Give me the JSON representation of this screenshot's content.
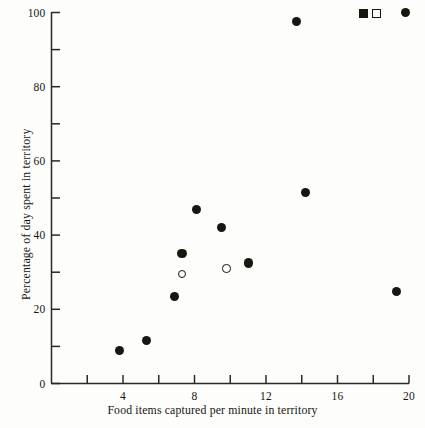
{
  "chart_data": {
    "type": "scatter",
    "title": "",
    "xlabel": "Food items captured per minute in territory",
    "ylabel": "Percentage of day spent in territory",
    "xlim": [
      0,
      20
    ],
    "ylim": [
      0,
      100
    ],
    "grid": false,
    "x_major_ticks": [
      4,
      8,
      12,
      16,
      20
    ],
    "x_minor_ticks": [
      2,
      6,
      10,
      14,
      18
    ],
    "x_tick_labels": [
      "4",
      "8",
      "12",
      "16",
      "20"
    ],
    "y_major_ticks": [
      0,
      20,
      40,
      60,
      80,
      100
    ],
    "y_minor_ticks": [
      10,
      30,
      50,
      70,
      90
    ],
    "y_tick_labels": [
      "0",
      "20",
      "40",
      "60",
      "80",
      "100"
    ],
    "legend_position": "top-right",
    "legend": [
      {
        "marker": "filled-square",
        "label": ""
      },
      {
        "marker": "open-square",
        "label": ""
      },
      {
        "marker": "filled-circle",
        "label": ""
      }
    ],
    "series": [
      {
        "name": "filled-circle",
        "marker": "filled-circle",
        "color": "#17170f",
        "points": [
          {
            "x": 3.8,
            "y": 9
          },
          {
            "x": 5.3,
            "y": 11.5
          },
          {
            "x": 6.9,
            "y": 23.5
          },
          {
            "x": 7.3,
            "y": 35
          },
          {
            "x": 8.1,
            "y": 47
          },
          {
            "x": 9.5,
            "y": 42
          },
          {
            "x": 11.0,
            "y": 32.5
          },
          {
            "x": 13.7,
            "y": 97.5
          },
          {
            "x": 14.2,
            "y": 51.5
          },
          {
            "x": 19.3,
            "y": 24.8
          },
          {
            "x": 19.8,
            "y": 100
          }
        ]
      },
      {
        "name": "open-circle",
        "marker": "open-circle",
        "color": "#17170f",
        "points": [
          {
            "x": 7.3,
            "y": 29.5
          },
          {
            "x": 9.8,
            "y": 31
          }
        ]
      }
    ]
  }
}
